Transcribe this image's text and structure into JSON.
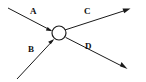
{
  "figure": {
    "type": "vector-diagram",
    "background_color": "#ffffff",
    "stroke_color": "#1a1a1a",
    "width": 146,
    "height": 82,
    "node": {
      "name": "junction-node",
      "shape": "circle",
      "cx": 59,
      "cy": 33,
      "r": 7,
      "fill": "#ffffff",
      "stroke": "#1a1a1a"
    },
    "vectors": [
      {
        "label": "A",
        "direction": "incoming",
        "from": [
          8,
          8
        ],
        "to": [
          52,
          31
        ],
        "arrowhead_at": "node",
        "label_pos": [
          33,
          12
        ]
      },
      {
        "label": "B",
        "direction": "incoming",
        "from": [
          17,
          78
        ],
        "to": [
          54,
          39
        ],
        "arrowhead_at": "node",
        "label_pos": [
          31,
          50
        ]
      },
      {
        "label": "C",
        "direction": "outgoing",
        "from": [
          65,
          30
        ],
        "to": [
          130,
          8
        ],
        "arrowhead_at": "end",
        "label_pos": [
          87,
          12
        ]
      },
      {
        "label": "D",
        "direction": "outgoing",
        "from": [
          66,
          37
        ],
        "to": [
          126,
          68
        ],
        "arrowhead_at": "end",
        "label_pos": [
          88,
          47
        ]
      }
    ]
  },
  "labels": {
    "a": "A",
    "b": "B",
    "c": "C",
    "d": "D"
  }
}
